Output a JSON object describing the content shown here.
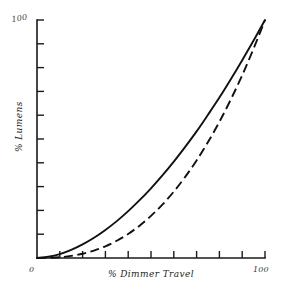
{
  "chart_data": {
    "type": "line",
    "title": "",
    "subtitle": "",
    "xlabel": "% Dimmer Travel",
    "ylabel": "% Lumens",
    "xlim": [
      0,
      100
    ],
    "ylim": [
      0,
      100
    ],
    "grid": false,
    "legend": "none",
    "x_tick_labels": [
      "0",
      "100"
    ],
    "y_tick_labels": [
      "100"
    ],
    "x_tick_count": 10,
    "y_tick_count": 10,
    "origin_label": "0",
    "x_max_label": "100",
    "y_max_label": "100",
    "series": [
      {
        "name": "solid-curve",
        "style": "solid",
        "exponent": 1.8,
        "x": [
          0,
          5,
          10,
          15,
          20,
          25,
          30,
          35,
          40,
          45,
          50,
          55,
          60,
          65,
          70,
          75,
          80,
          85,
          90,
          95,
          100
        ],
        "values": [
          0,
          0.5,
          1.6,
          3.4,
          5.7,
          8.5,
          11.8,
          15.5,
          19.7,
          24.3,
          29.3,
          34.7,
          40.5,
          46.7,
          53.2,
          60.2,
          67.4,
          75.1,
          83.1,
          91.4,
          100
        ]
      },
      {
        "name": "dashed-curve",
        "style": "dashed",
        "exponent": 2.5,
        "x": [
          0,
          5,
          10,
          15,
          20,
          25,
          30,
          35,
          40,
          45,
          50,
          55,
          60,
          65,
          70,
          75,
          80,
          85,
          90,
          95,
          100
        ],
        "values": [
          0,
          0.06,
          0.32,
          0.87,
          1.79,
          3.13,
          4.93,
          7.24,
          10.1,
          13.6,
          17.7,
          22.4,
          27.9,
          34.1,
          41.0,
          48.7,
          57.2,
          66.6,
          76.8,
          88.0,
          100
        ]
      }
    ],
    "colors": {
      "axis": "#1a1a1a",
      "curve": "#111111",
      "background": "#ffffff",
      "label": "#2b2b2b"
    }
  }
}
